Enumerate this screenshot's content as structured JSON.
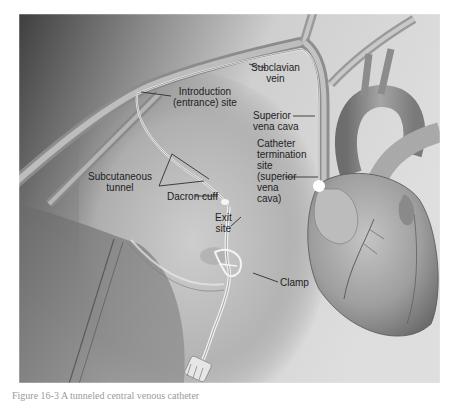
{
  "figure": {
    "labels": {
      "subclavian_vein": [
        "Subclavian",
        "vein"
      ],
      "introduction_site": [
        "Introduction",
        "(entrance) site"
      ],
      "superior_vena_cava": [
        "Superior",
        "vena cava"
      ],
      "catheter_termination": [
        "Catheter",
        "termination",
        "site",
        "(superior",
        "vena",
        "cava)"
      ],
      "subcutaneous_tunnel": [
        "Subcutaneous",
        "tunnel"
      ],
      "dacron_cuff": "Dacron cuff",
      "exit_site": [
        "Exit",
        "site"
      ],
      "clamp": "Clamp"
    },
    "colors": {
      "background_dark": "#4a4a4a",
      "background_light": "#d8d8d8",
      "label_text": "#1e1e1e",
      "heart": "#9c9c9c"
    }
  },
  "caption": {
    "text": "Figure 16-3  A tunneled central venous catheter"
  }
}
